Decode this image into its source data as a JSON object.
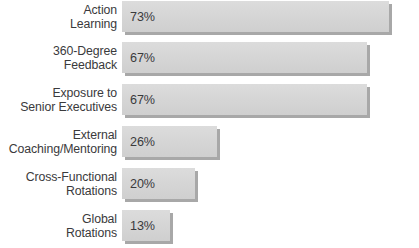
{
  "chart_data": {
    "type": "bar",
    "orientation": "horizontal",
    "title": "",
    "subtitle": "",
    "xlabel": "",
    "ylabel": "",
    "xlim": [
      0,
      73
    ],
    "grid": false,
    "legend": null,
    "value_suffix": "%",
    "categories": [
      "Action\nLearning",
      "360-Degree\nFeedback",
      "Exposure to\nSenior Executives",
      "External\nCoaching/Mentoring",
      "Cross-Functional\nRotations",
      "Global\nRotations"
    ],
    "values": [
      73,
      67,
      67,
      26,
      20,
      13
    ],
    "value_labels": [
      "73%",
      "67%",
      "67%",
      "26%",
      "20%",
      "13%"
    ],
    "colors": {
      "bar_fill": "#d6d6d6",
      "bar_shadow": "#a8a8a8",
      "text": "#3a3a3c",
      "background": "#ffffff"
    }
  }
}
